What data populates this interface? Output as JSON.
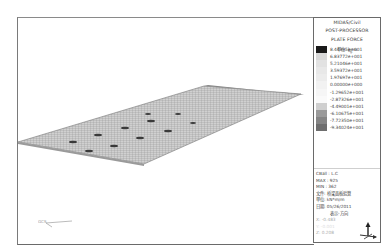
{
  "legend": {
    "program": "MIDAS/Civil",
    "mode": "POST-PROCESSOR",
    "result": "PLATE FORCE",
    "unit_line": "単位: ㎏/m",
    "scale": [
      {
        "value": "8.44395e+001",
        "color": "#1a1a1a"
      },
      {
        "value": "6.83772e+001",
        "color": "#d8d8d8"
      },
      {
        "value": "5.21046e+001",
        "color": "#e2e2e2"
      },
      {
        "value": "3.59372e+001",
        "color": "#e8e8e8"
      },
      {
        "value": "1.97697e+001",
        "color": "#ececec"
      },
      {
        "value": "0.00000e+000",
        "color": "#f2f2f2"
      },
      {
        "value": "-1.29652e+001",
        "color": "#f6f6f6"
      },
      {
        "value": "-2.87326e+001",
        "color": "#fafafa"
      },
      {
        "value": "-4.49001e+001",
        "color": "#cfcfcf"
      },
      {
        "value": "-6.10675e+001",
        "color": "#9a9a9a"
      },
      {
        "value": "-7.72350e+001",
        "color": "#858585"
      },
      {
        "value": "-9.34024e+001",
        "color": "#6e6e6e"
      }
    ],
    "info": {
      "cbase": "CBall : L.C",
      "max": "MAX : 925",
      "min": "MIN : 362",
      "file_line": "文件: 桥梁面板验算",
      "unit_label": "単位: kN*m/m",
      "date_line": "日期: 05/26/2011",
      "view_label": "表示-方向",
      "x_line": "X: -0.483",
      "y_line": "Y: -0.001",
      "z_line": "Z: 0.208"
    }
  },
  "viewport": {
    "gcs_label": "GCS"
  }
}
